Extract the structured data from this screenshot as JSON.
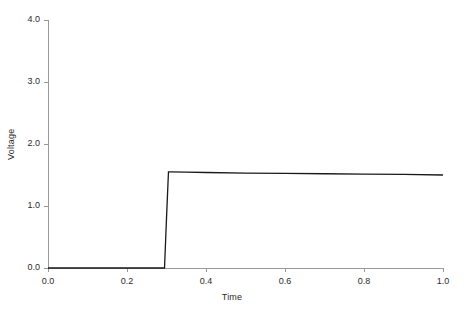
{
  "chart_data": {
    "type": "line",
    "title": "",
    "xlabel": "Time",
    "ylabel": "Voltage",
    "xlim": [
      0.0,
      1.0
    ],
    "ylim": [
      0.0,
      4.0
    ],
    "xticks": [
      "0.0",
      "0.2",
      "0.4",
      "0.6",
      "0.8",
      "1.0"
    ],
    "xtick_values": [
      0.0,
      0.2,
      0.4,
      0.6,
      0.8,
      1.0
    ],
    "yticks": [
      "0.0",
      "1.0",
      "2.0",
      "3.0",
      "4.0"
    ],
    "ytick_values": [
      0.0,
      1.0,
      2.0,
      3.0,
      4.0
    ],
    "grid": false,
    "legend": null,
    "line_color": "#1a1a1a",
    "axis_color": "#999999",
    "background": "#ffffff",
    "series": [
      {
        "name": "Voltage",
        "x": [
          0.0,
          0.05,
          0.1,
          0.15,
          0.2,
          0.25,
          0.295,
          0.3,
          0.305,
          0.31,
          0.35,
          0.4,
          0.5,
          0.6,
          0.7,
          0.8,
          0.9,
          1.0
        ],
        "y": [
          0.0,
          0.0,
          0.0,
          0.0,
          0.0,
          0.0,
          0.0,
          0.8,
          1.55,
          1.55,
          1.545,
          1.54,
          1.53,
          1.525,
          1.52,
          1.515,
          1.51,
          1.5
        ]
      }
    ],
    "annotations": [
      "Step response: output stays at 0.0 V until t = 0.3, then rises sharply to about 1.55 V and decays slowly to about 1.50 V at t = 1.0."
    ]
  }
}
